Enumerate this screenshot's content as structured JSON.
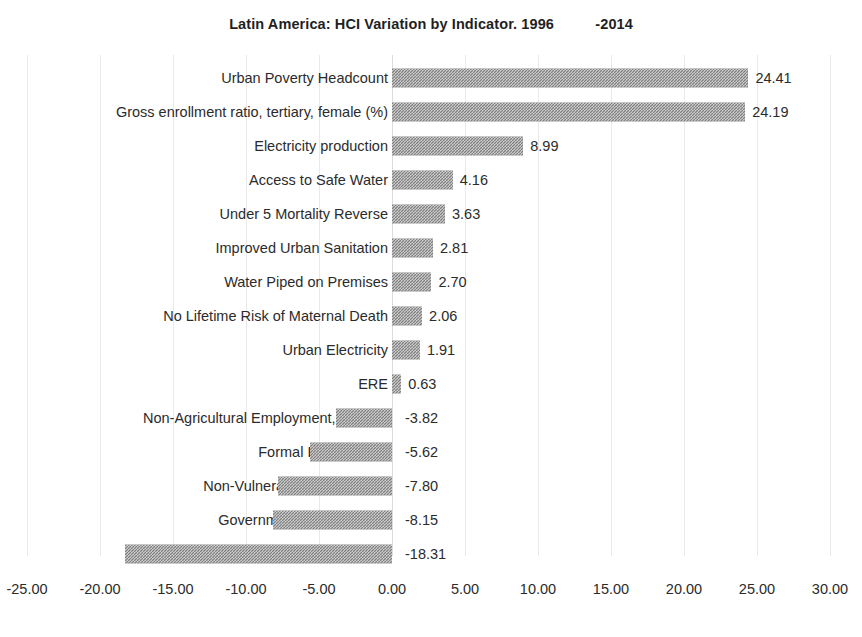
{
  "chart_data": {
    "type": "bar",
    "orientation": "horizontal",
    "title": "Latin America: HCI Variation by Indicator. 1996          -2014",
    "title_main": "Latin America: HCI Variation by Indicator. 1996",
    "title_suffix": "-2014",
    "xlabel": "",
    "ylabel": "",
    "xlim": [
      -25,
      30
    ],
    "grid": true,
    "legend": "none",
    "xticks": [
      -25,
      -20,
      -15,
      -10,
      -5,
      0,
      5,
      10,
      15,
      20,
      25,
      30
    ],
    "xtick_labels": [
      "-25.00",
      "-20.00",
      "-15.00",
      "-10.00",
      "-5.00",
      "0.00",
      "5.00",
      "10.00",
      "15.00",
      "20.00",
      "25.00",
      "30.00"
    ],
    "categories": [
      "Urban Poverty Headcount",
      "Gross enrollment ratio, tertiary, female (%)",
      "Electricity production",
      "Access to Safe Water",
      "Under 5 Mortality Reverse",
      "Improved Urban Sanitation",
      "Water Piped on Premises",
      "No Lifetime Risk of Maternal Death",
      "Urban Electricity",
      "ERE",
      "Non-Agricultural Employment, Female",
      "Formal Employment",
      "Non-Vulnerable Employment",
      "Government Effectiveness",
      "Quality of Government"
    ],
    "values": [
      24.41,
      24.19,
      8.99,
      4.16,
      3.63,
      2.81,
      2.7,
      2.06,
      1.91,
      0.63,
      -3.82,
      -5.62,
      -7.8,
      -8.15,
      -18.31
    ],
    "value_labels": [
      "24.41",
      "24.19",
      "8.99",
      "4.16",
      "3.63",
      "2.81",
      "2.70",
      "2.06",
      "1.91",
      "0.63",
      "-3.82",
      "-5.62",
      "-7.80",
      "-8.15",
      "-18.31"
    ],
    "bar_color": "#808080",
    "bar_pattern": "checkerboard-dither"
  }
}
